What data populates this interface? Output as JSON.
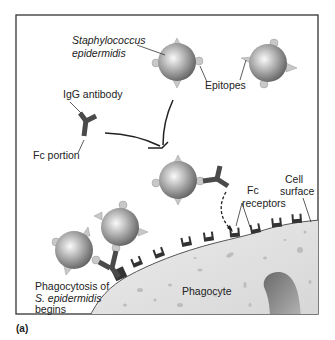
{
  "figure": {
    "panel_label": "(a)",
    "labels": {
      "staph_line1": "Staphylococcus",
      "staph_line2": "epidermidis",
      "epitopes": "Epitopes",
      "igg_antibody": "IgG antibody",
      "fc_portion": "Fc portion",
      "fc_receptors_line1": "Fc",
      "fc_receptors_line2": "receptors",
      "cell_surface_line1": "Cell",
      "cell_surface_line2": "surface",
      "phagocytosis_line1": "Phagocytosis of",
      "phagocytosis_line2": "S. epidermidis",
      "phagocytosis_line3": "begins",
      "phagocyte": "Phagocyte"
    },
    "colors": {
      "frame": "#333333",
      "bacterium_light": "#f4f4f4",
      "bacterium_dark": "#6e6e6e",
      "epitope": "#c8c8c8",
      "antibody": "#4a4a4a",
      "receptor": "#333333",
      "cytoplasm": "#e2e2e2",
      "nucleus": "#7a7a7a"
    }
  }
}
